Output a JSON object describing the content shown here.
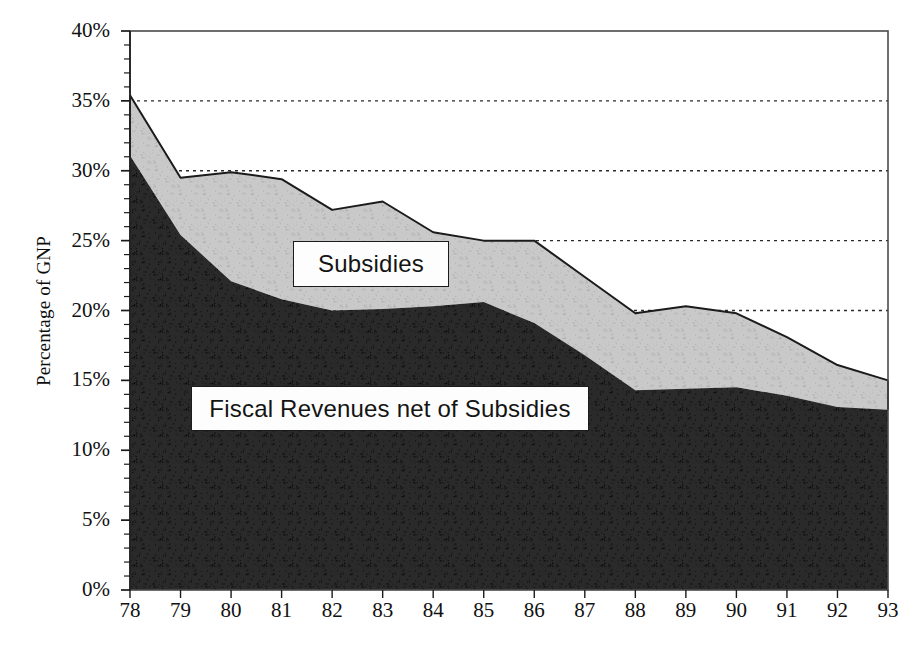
{
  "chart_data": {
    "type": "area",
    "stacked": true,
    "title": "",
    "subtitle": "",
    "xlabel": "",
    "ylabel": "Percentage of GNP",
    "categories": [
      "78",
      "79",
      "80",
      "81",
      "82",
      "83",
      "84",
      "85",
      "86",
      "87",
      "88",
      "89",
      "90",
      "91",
      "92",
      "93"
    ],
    "x_tick_labels": [
      "78",
      "79",
      "80",
      "81",
      "82",
      "83",
      "84",
      "85",
      "86",
      "87",
      "88",
      "89",
      "90",
      "91",
      "92",
      "93"
    ],
    "y_tick_labels": [
      "0%",
      "5%",
      "10%",
      "15%",
      "20%",
      "25%",
      "30%",
      "35%",
      "40%"
    ],
    "y_tick_values": [
      0,
      5,
      10,
      15,
      20,
      25,
      30,
      35,
      40
    ],
    "ylim": [
      0,
      40
    ],
    "y_minor_ticks": true,
    "grid": "horizontal-dotted",
    "legend_position": "inside-plot",
    "series": [
      {
        "name": "Fiscal Revenues net of Subsidies",
        "fill": "#2a2a2a",
        "values": [
          31.1,
          25.4,
          22.1,
          20.8,
          20.0,
          20.1,
          20.3,
          20.6,
          19.1,
          16.8,
          14.3,
          14.4,
          14.5,
          13.9,
          13.1,
          12.9
        ]
      },
      {
        "name": "Subsidies",
        "fill": "#c9c9c9",
        "values": [
          4.3,
          4.1,
          7.8,
          8.6,
          7.2,
          7.7,
          5.3,
          4.4,
          5.9,
          5.6,
          5.5,
          5.9,
          5.3,
          4.2,
          3.0,
          2.1
        ]
      }
    ],
    "totals": [
      35.4,
      29.5,
      29.9,
      29.4,
      27.2,
      27.8,
      25.6,
      25.0,
      25.0,
      22.4,
      19.8,
      20.3,
      19.8,
      18.1,
      16.1,
      15.0
    ],
    "annotations": [
      {
        "text": "Subsidies",
        "target": "upper-band"
      },
      {
        "text": "Fiscal Revenues net of Subsidies",
        "target": "lower-band"
      }
    ]
  },
  "axes": {
    "y_title": "Percentage of GNP"
  },
  "legend": {
    "subsidies_label": "Subsidies",
    "revenues_label": "Fiscal Revenues net of Subsidies"
  },
  "colors": {
    "lower_band": "#2a2a2a",
    "upper_band": "#c9c9c9",
    "frame": "#4a4a4a",
    "line": "#1b1b1b",
    "grid": "#2b2b2b",
    "text": "#111111"
  }
}
